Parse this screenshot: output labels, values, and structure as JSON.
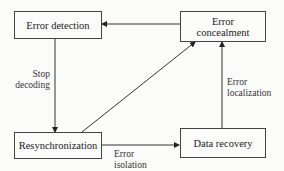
{
  "diagram": {
    "nodes": {
      "error_detection": {
        "label": "Error detection"
      },
      "error_concealment": {
        "line1": "Error",
        "line2": "concealment"
      },
      "resynchronization": {
        "label": "Resynchronization"
      },
      "data_recovery": {
        "label": "Data recovery"
      }
    },
    "edges": [
      {
        "from": "error_concealment",
        "to": "error_detection",
        "label": ""
      },
      {
        "from": "error_detection",
        "to": "resynchronization",
        "label": "Stop decoding"
      },
      {
        "from": "resynchronization",
        "to": "error_concealment",
        "label": ""
      },
      {
        "from": "resynchronization",
        "to": "data_recovery",
        "label": "Error isolation"
      },
      {
        "from": "data_recovery",
        "to": "error_concealment",
        "label": "Error localization"
      }
    ],
    "edge_labels": {
      "stop_decoding": {
        "line1": "Stop",
        "line2": "decoding"
      },
      "error_localization": {
        "line1": "Error",
        "line2": "localization"
      },
      "error_isolation": {
        "line1": "Error",
        "line2": "isolation"
      }
    },
    "colors": {
      "line": "#333333",
      "background": "#fbfbfa"
    }
  }
}
